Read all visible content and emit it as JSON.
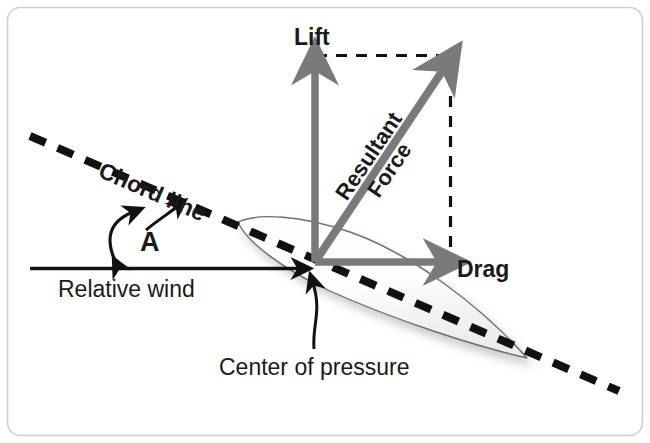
{
  "figure": {
    "type": "aerodynamics-force-diagram",
    "border_color": "#cfcfcf",
    "background_color": "#ffffff",
    "arrow_color": "#7a7a7a",
    "line_color": "#111111",
    "text_color": "#1a1a1a"
  },
  "labels": {
    "lift": "Lift",
    "drag": "Drag",
    "resultant_line1": "Resultant",
    "resultant_line2": "Force",
    "chord_line": "Chord line",
    "relative_wind": "Relative wind",
    "angle": "A",
    "center_of_pressure": "Center of pressure"
  },
  "vectors": [
    {
      "name": "lift",
      "label": "Lift",
      "direction": "up",
      "color": "#7a7a7a",
      "origin": [
        315,
        262
      ],
      "tip": [
        315,
        57
      ]
    },
    {
      "name": "drag",
      "label": "Drag",
      "direction": "right",
      "color": "#7a7a7a",
      "origin": [
        315,
        262
      ],
      "tip": [
        452,
        262
      ]
    },
    {
      "name": "resultant-force",
      "label": "Resultant Force",
      "direction": "up-right",
      "color": "#7a7a7a",
      "origin": [
        315,
        262
      ],
      "tip": [
        452,
        57
      ]
    }
  ],
  "reference_lines": [
    {
      "name": "chord-line",
      "style": "dashed",
      "label": "Chord line",
      "color": "#111111"
    },
    {
      "name": "relative-wind-line",
      "style": "solid",
      "label": "Relative wind",
      "color": "#111111"
    },
    {
      "name": "parallelogram-top",
      "style": "dashed",
      "color": "#111111"
    },
    {
      "name": "parallelogram-right",
      "style": "dashed",
      "color": "#111111"
    }
  ],
  "annotations": [
    {
      "name": "angle-of-attack",
      "label": "A",
      "description": "angle between chord line and relative wind"
    },
    {
      "name": "center-of-pressure",
      "label": "Center of pressure"
    }
  ]
}
